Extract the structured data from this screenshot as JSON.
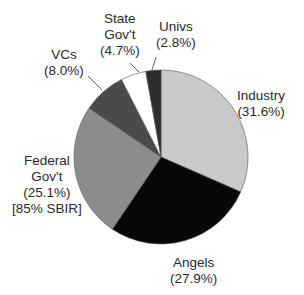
{
  "chart_data": {
    "type": "pie",
    "title": "",
    "start_angle": "12 o'clock",
    "direction": "clockwise",
    "slices": [
      {
        "name": "Industry",
        "value": 31.6,
        "label": "Industry",
        "pct": "(31.6%)",
        "note": "",
        "color": "#c9c9c9"
      },
      {
        "name": "Angels",
        "value": 27.9,
        "label": "Angels",
        "pct": "(27.9%)",
        "note": "",
        "color": "#080808"
      },
      {
        "name": "Federal Gov't",
        "value": 25.1,
        "label": "Federal Gov't",
        "pct": "(25.1%)",
        "note": "[85% SBIR]",
        "color": "#8c8c8c"
      },
      {
        "name": "VCs",
        "value": 8.0,
        "label": "VCs",
        "pct": "(8.0%)",
        "note": "",
        "color": "#4a4a4a"
      },
      {
        "name": "State Gov't",
        "value": 4.7,
        "label": "State Gov't",
        "pct": "(4.7%)",
        "note": "",
        "color": "#ffffff"
      },
      {
        "name": "Univs",
        "value": 2.8,
        "label": "Univs",
        "pct": "(2.8%)",
        "note": "",
        "color": "#2e2e2e"
      }
    ],
    "categories": [
      "Industry",
      "Angels",
      "Federal Gov't",
      "VCs",
      "State Gov't",
      "Univs"
    ],
    "values": [
      31.6,
      27.9,
      25.1,
      8.0,
      4.7,
      2.8
    ],
    "legend": "none (direct labels)"
  },
  "labels": {
    "industry": {
      "line1": "Industry",
      "line2": "(31.6%)"
    },
    "angels": {
      "line1": "Angels",
      "line2": "(27.9%)"
    },
    "federal": {
      "line1": "Federal",
      "line2": "Gov't",
      "line3": "(25.1%)",
      "line4": "[85% SBIR]"
    },
    "vcs": {
      "line1": "VCs",
      "line2": "(8.0%)"
    },
    "state": {
      "line1": "State",
      "line2": "Gov't",
      "line3": "(4.7%)"
    },
    "univs": {
      "line1": "Univs",
      "line2": "(2.8%)"
    }
  }
}
